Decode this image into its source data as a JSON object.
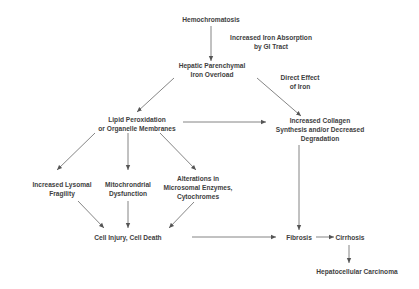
{
  "diagram": {
    "nodes": {
      "hemochromatosis": {
        "lines": [
          "Hemochromatosis"
        ]
      },
      "hepatic_overload": {
        "lines": [
          "Hepatic Parenchymal",
          "Iron Overload"
        ]
      },
      "lipid_peroxidation": {
        "lines": [
          "Lipid Peroxidation",
          "or Organelle Membranes"
        ]
      },
      "collagen": {
        "lines": [
          "Increased Collagen",
          "Synthesis and/or Decreased",
          "Degradation"
        ]
      },
      "lysosomal": {
        "lines": [
          "Increased Lysomal",
          "Fragility"
        ]
      },
      "mitochondrial": {
        "lines": [
          "Mitochrondrial",
          "Dysfunction"
        ]
      },
      "microsomal": {
        "lines": [
          "Alterations in",
          "Microsomal Enzymes,",
          "Cytochromes"
        ]
      },
      "cell_injury": {
        "lines": [
          "Cell Injury, Cell Death"
        ]
      },
      "fibrosis": {
        "lines": [
          "Fibrosis"
        ]
      },
      "cirrhosis": {
        "lines": [
          "Cirrhosis"
        ]
      },
      "carcinoma": {
        "lines": [
          "Hepatocellular Carcinoma"
        ]
      }
    },
    "edge_labels": {
      "iron_absorption": {
        "lines": [
          "Increased Iron Absorption",
          "by GI Tract"
        ]
      },
      "direct_effect": {
        "lines": [
          "Direct Effect",
          "of Iron"
        ]
      }
    },
    "edges": [
      {
        "from": "hemochromatosis",
        "to": "hepatic_overload",
        "label": "iron_absorption"
      },
      {
        "from": "hepatic_overload",
        "to": "lipid_peroxidation"
      },
      {
        "from": "hepatic_overload",
        "to": "collagen",
        "label": "direct_effect"
      },
      {
        "from": "lipid_peroxidation",
        "to": "collagen"
      },
      {
        "from": "lipid_peroxidation",
        "to": "lysosomal"
      },
      {
        "from": "lipid_peroxidation",
        "to": "mitochondrial"
      },
      {
        "from": "lipid_peroxidation",
        "to": "microsomal"
      },
      {
        "from": "lysosomal",
        "to": "cell_injury"
      },
      {
        "from": "mitochondrial",
        "to": "cell_injury"
      },
      {
        "from": "microsomal",
        "to": "cell_injury"
      },
      {
        "from": "collagen",
        "to": "fibrosis"
      },
      {
        "from": "cell_injury",
        "to": "fibrosis"
      },
      {
        "from": "fibrosis",
        "to": "cirrhosis"
      },
      {
        "from": "cirrhosis",
        "to": "carcinoma"
      }
    ],
    "colors": {
      "text": "#3e3e3e",
      "line": "#555555",
      "background": "#ffffff"
    }
  }
}
